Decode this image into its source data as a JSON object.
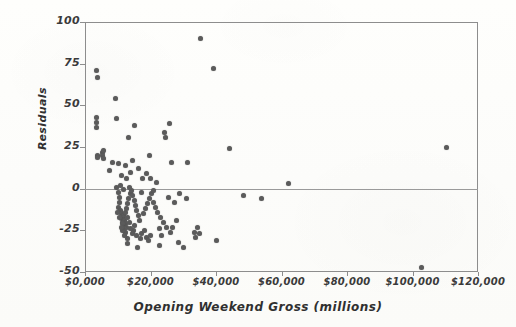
{
  "figure": {
    "background_color": "#fdfdfb",
    "axis_color": "#8d8d8d",
    "point_color": "#5b5b5b",
    "zero_line_color": "#9a9a9a"
  },
  "axes": {
    "y_title": "Residuals",
    "x_title": "Opening Weekend Gross (millions)",
    "y_ticks": [
      "100",
      "75",
      "50",
      "25",
      "0",
      "-25",
      "-50"
    ],
    "x_ticks": [
      "$0,000",
      "$20,000",
      "$40,000",
      "$60,000",
      "$80,000",
      "$100,000",
      "$120,000"
    ]
  },
  "chart_data": {
    "type": "scatter",
    "title": "",
    "xlabel": "Opening Weekend Gross (millions)",
    "ylabel": "Residuals",
    "xlim": [
      0,
      120000
    ],
    "ylim": [
      -50,
      100
    ],
    "x_tick_values": [
      0,
      20000,
      40000,
      60000,
      80000,
      100000,
      120000
    ],
    "y_tick_values": [
      -50,
      -25,
      0,
      25,
      50,
      75,
      100
    ],
    "grid": false,
    "legend": null,
    "reference_lines": [
      {
        "axis": "y",
        "value": 0,
        "label": "zero residual line"
      }
    ],
    "series": [
      {
        "name": "residuals",
        "marker": "filled-circle",
        "color": "#5b5b5b",
        "points": [
          [
            3600,
            71
          ],
          [
            3700,
            67
          ],
          [
            3500,
            43
          ],
          [
            3600,
            40
          ],
          [
            3500,
            37
          ],
          [
            3700,
            20
          ],
          [
            3800,
            19
          ],
          [
            5200,
            22
          ],
          [
            5400,
            20
          ],
          [
            5600,
            23
          ],
          [
            5500,
            18
          ],
          [
            7400,
            11
          ],
          [
            9200,
            54
          ],
          [
            9600,
            42
          ],
          [
            8300,
            16
          ],
          [
            10200,
            15
          ],
          [
            11000,
            8
          ],
          [
            12400,
            14
          ],
          [
            14600,
            17
          ],
          [
            13300,
            31
          ],
          [
            15100,
            38
          ],
          [
            19800,
            20
          ],
          [
            24200,
            34
          ],
          [
            25800,
            39
          ],
          [
            24600,
            31
          ],
          [
            26500,
            16
          ],
          [
            31200,
            16
          ],
          [
            35200,
            90
          ],
          [
            39100,
            72
          ],
          [
            44200,
            24
          ],
          [
            48500,
            -4
          ],
          [
            53800,
            -6
          ],
          [
            62000,
            3
          ],
          [
            110500,
            25
          ],
          [
            9700,
            1
          ],
          [
            10100,
            -2
          ],
          [
            10400,
            -5
          ],
          [
            10600,
            -8
          ],
          [
            10300,
            -11
          ],
          [
            10800,
            -13
          ],
          [
            11200,
            -15
          ],
          [
            11500,
            -17
          ],
          [
            11000,
            -18
          ],
          [
            11400,
            -20
          ],
          [
            11800,
            -16
          ],
          [
            12100,
            -19
          ],
          [
            12500,
            -21
          ],
          [
            11900,
            -22
          ],
          [
            12300,
            -14
          ],
          [
            12700,
            -12
          ],
          [
            13100,
            -9
          ],
          [
            13400,
            -6
          ],
          [
            13800,
            -3
          ],
          [
            14200,
            -1
          ],
          [
            14600,
            -4
          ],
          [
            15000,
            -7
          ],
          [
            15400,
            -10
          ],
          [
            15800,
            -13
          ],
          [
            16200,
            -16
          ],
          [
            16600,
            -19
          ],
          [
            15200,
            -22
          ],
          [
            14800,
            -25
          ],
          [
            14400,
            -27
          ],
          [
            13900,
            -24
          ],
          [
            13500,
            -20
          ],
          [
            13100,
            -17
          ],
          [
            12800,
            -23
          ],
          [
            12400,
            -26
          ],
          [
            12000,
            -24
          ],
          [
            11600,
            -21
          ],
          [
            11300,
            -25
          ],
          [
            12900,
            -30
          ],
          [
            15600,
            -28
          ],
          [
            16800,
            -30
          ],
          [
            17400,
            -27
          ],
          [
            18100,
            -25
          ],
          [
            18700,
            -29
          ],
          [
            19300,
            -31
          ],
          [
            19900,
            -28
          ],
          [
            17900,
            -15
          ],
          [
            18500,
            -12
          ],
          [
            19100,
            -9
          ],
          [
            19700,
            -6
          ],
          [
            20300,
            -3
          ],
          [
            20900,
            -8
          ],
          [
            21500,
            -11
          ],
          [
            22100,
            -14
          ],
          [
            17200,
            -2
          ],
          [
            21000,
            -1
          ],
          [
            23000,
            -17
          ],
          [
            24000,
            -20
          ],
          [
            25000,
            -23
          ],
          [
            26000,
            -26
          ],
          [
            26600,
            -23
          ],
          [
            22600,
            -24
          ],
          [
            23400,
            -28
          ],
          [
            27800,
            -19
          ],
          [
            28600,
            -32
          ],
          [
            30200,
            -35
          ],
          [
            33400,
            -26
          ],
          [
            34200,
            -23
          ],
          [
            33800,
            -29
          ],
          [
            35000,
            -27
          ],
          [
            102800,
            -47
          ],
          [
            15900,
            -35
          ],
          [
            22800,
            -34
          ],
          [
            40000,
            -31
          ],
          [
            25400,
            -5
          ],
          [
            27200,
            -8
          ],
          [
            29000,
            -3
          ],
          [
            31000,
            -6
          ],
          [
            20000,
            6
          ],
          [
            21800,
            4
          ],
          [
            18900,
            9
          ],
          [
            16400,
            12
          ],
          [
            17600,
            6
          ],
          [
            14000,
            10
          ],
          [
            12600,
            6
          ],
          [
            11700,
            -0.5
          ],
          [
            13700,
            1
          ],
          [
            10900,
            2
          ],
          [
            9900,
            -14
          ],
          [
            10500,
            -17
          ],
          [
            11100,
            -23
          ],
          [
            12200,
            -28
          ],
          [
            13000,
            -33
          ]
        ]
      }
    ]
  }
}
